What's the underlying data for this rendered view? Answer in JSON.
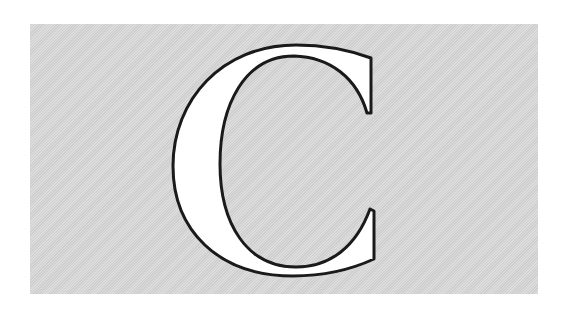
{
  "glyph": {
    "character": "C",
    "fill": "#ffffff",
    "outline": "#1a1a1a"
  },
  "background": {
    "panel_color": "#d6d6d6",
    "page_color": "#ffffff"
  }
}
